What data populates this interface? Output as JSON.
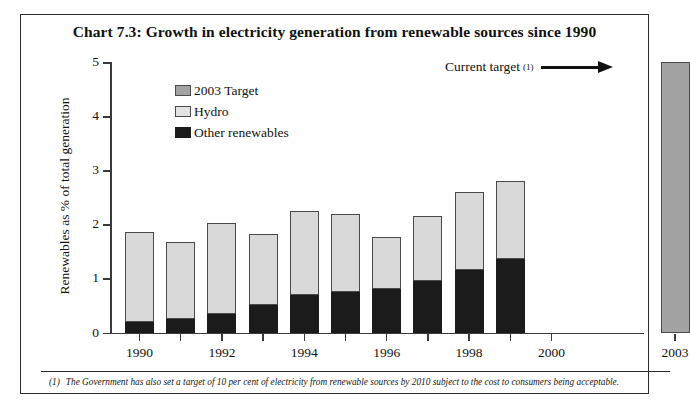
{
  "chart_data": {
    "type": "bar",
    "title": "Chart 7.3: Growth in electricity generation from renewable sources since 1990",
    "xlabel": "",
    "ylabel": "Renewables as % of total generation",
    "ylim": [
      0,
      5
    ],
    "ytick_labels": [
      "0",
      "1",
      "2",
      "3",
      "4",
      "5"
    ],
    "ytick_values": [
      0,
      1,
      2,
      3,
      4,
      5
    ],
    "grid": false,
    "stacked": true,
    "legend_position": "upper-left-inside",
    "categories": [
      "1990",
      "1991",
      "1992",
      "1993",
      "1994",
      "1995",
      "1996",
      "1997",
      "1998",
      "1999",
      "2000",
      "2001",
      "2002",
      "2003"
    ],
    "xtick_labels_shown": [
      "1990",
      "1992",
      "1994",
      "1996",
      "1998",
      "2000",
      "2003"
    ],
    "series": [
      {
        "name": "Other renewables",
        "color": "#1b1b1b",
        "values": [
          0.2,
          0.25,
          0.35,
          0.5,
          0.7,
          0.75,
          0.8,
          0.95,
          1.15,
          1.35,
          null,
          null,
          null,
          null
        ]
      },
      {
        "name": "Hydro",
        "color": "#d9d9d9",
        "values": [
          1.65,
          1.43,
          1.68,
          1.33,
          1.55,
          1.45,
          0.97,
          1.2,
          1.45,
          1.45,
          null,
          null,
          null,
          null
        ]
      },
      {
        "name": "2003 Target",
        "color": "#a3a3a3",
        "values": [
          null,
          null,
          null,
          null,
          null,
          null,
          null,
          null,
          null,
          null,
          null,
          null,
          null,
          5.0
        ]
      }
    ],
    "totals": [
      1.85,
      1.68,
      2.03,
      1.83,
      2.25,
      2.2,
      1.77,
      2.15,
      2.6,
      2.8,
      null,
      null,
      null,
      5.0
    ],
    "annotation": {
      "text": "Current target",
      "superscript": "(1)",
      "arrow": "right-arrow-to-2003-bar"
    }
  },
  "legend": {
    "items": [
      {
        "label": "2003 Target",
        "swatch": "target"
      },
      {
        "label": "Hydro",
        "swatch": "hydro"
      },
      {
        "label": "Other renewables",
        "swatch": "other"
      }
    ]
  },
  "footnote": {
    "marker": "(1)",
    "text": "The Government has also set a target of 10 per cent of electricity from renewable sources by 2010 subject to the cost to consumers being acceptable."
  }
}
